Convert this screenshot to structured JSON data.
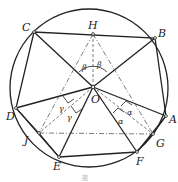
{
  "diagram": {
    "circle": {
      "cx": 89,
      "cy": 88,
      "r": 79
    },
    "points": {
      "A": {
        "x": 166,
        "y": 116,
        "label": "A",
        "lx": 169,
        "ly": 123
      },
      "B": {
        "x": 155,
        "y": 38,
        "label": "B",
        "lx": 158,
        "ly": 37
      },
      "C": {
        "x": 34,
        "y": 32,
        "label": "C",
        "lx": 22,
        "ly": 31
      },
      "D": {
        "x": 16,
        "y": 108,
        "label": "D",
        "lx": 6,
        "ly": 120
      },
      "E": {
        "x": 59,
        "y": 157,
        "label": "E",
        "lx": 53,
        "ly": 170
      },
      "F": {
        "x": 137,
        "y": 152,
        "label": "F",
        "lx": 136,
        "ly": 165
      },
      "G": {
        "x": 153,
        "y": 134,
        "label": "G",
        "lx": 156,
        "ly": 147
      },
      "H": {
        "x": 93,
        "y": 34,
        "label": "H",
        "lx": 88,
        "ly": 29
      },
      "J": {
        "x": 39,
        "y": 133,
        "label": "J",
        "lx": 24,
        "ly": 144
      },
      "O": {
        "x": 93,
        "y": 87,
        "label": "O",
        "lx": 91,
        "ly": 103
      }
    },
    "angle_labels": {
      "beta": "β",
      "alpha": "α",
      "gamma": "γ"
    },
    "caption": "图"
  }
}
